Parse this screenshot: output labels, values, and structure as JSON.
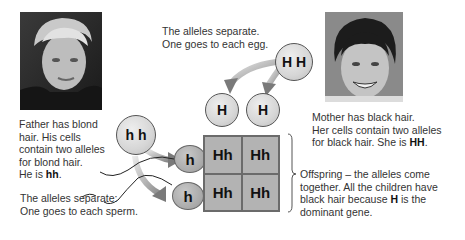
{
  "father": {
    "photo_label": "father-photo",
    "description_lines": [
      "Father has blond",
      "hair. His cells",
      "contain two alleles",
      "for blond hair."
    ],
    "genotype_prefix": "He is ",
    "genotype": "hh",
    "genotype_suffix": ".",
    "cell_alleles": "h h",
    "separate_lines": [
      "The alleles separate:",
      "One goes to each sperm."
    ],
    "sperm_alleles": [
      "h",
      "h"
    ]
  },
  "mother": {
    "photo_label": "mother-photo",
    "description_lines": [
      "Mother has black hair.",
      "Her cells contain two alleles"
    ],
    "description_last_prefix": "for black hair.  She is ",
    "genotype": "HH",
    "genotype_suffix": ".",
    "cell_alleles": "H H",
    "separate_lines": [
      "The alleles separate.",
      "One goes to each egg."
    ],
    "egg_alleles": [
      "H",
      "H"
    ]
  },
  "punnett": {
    "cells": [
      "Hh",
      "Hh",
      "Hh",
      "Hh"
    ]
  },
  "offspring": {
    "lines_1": [
      "Offspring – the alleles come",
      "together. All the children have"
    ],
    "line_3_prefix": "black hair because ",
    "line_3_bold": "H",
    "line_3_suffix": " is the",
    "line_4": "dominant gene."
  },
  "colors": {
    "grid_fill": "#b3b3b3",
    "circle_fill": "#d6d6d6",
    "sperm_fill": "#a8a8a8",
    "text": "#333333"
  }
}
